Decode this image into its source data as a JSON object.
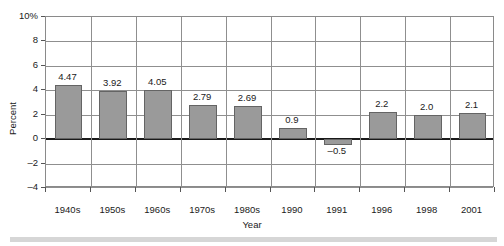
{
  "chart_data": {
    "type": "bar",
    "title": "",
    "xlabel": "Year",
    "ylabel": "Percent",
    "categories": [
      "1940s",
      "1950s",
      "1960s",
      "1970s",
      "1980s",
      "1990",
      "1991",
      "1996",
      "1998",
      "2001"
    ],
    "values": [
      4.47,
      3.92,
      4.05,
      2.79,
      2.69,
      0.9,
      -0.5,
      2.2,
      2.0,
      2.1
    ],
    "value_labels": [
      "4.47",
      "3.92",
      "4.05",
      "2.79",
      "2.69",
      "0.9",
      "–0.5",
      "2.2",
      "2.0",
      "2.1"
    ],
    "ylim": [
      -4,
      10
    ],
    "ytick_values": [
      10,
      8,
      6,
      4,
      2,
      0,
      -2,
      -4
    ],
    "ytick_labels": [
      "10%",
      "8",
      "6",
      "4",
      "2",
      "0",
      "–2",
      "–4"
    ],
    "grid": true,
    "legend": null,
    "bar_color": "#9a9a9a",
    "bar_border_color": "#646464",
    "grid_color": "#8f8f8f",
    "zero_line_color": "#1a1a1a"
  },
  "footer": {
    "band_color": "#d6d6d6"
  }
}
